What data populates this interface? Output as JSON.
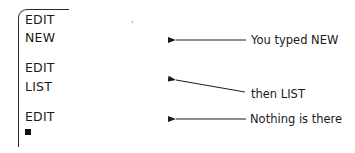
{
  "terminal": {
    "lines": [
      {
        "text": "EDIT"
      },
      {
        "text": "NEW"
      },
      {
        "text": "EDIT"
      },
      {
        "text": "LIST"
      },
      {
        "text": "EDIT"
      }
    ],
    "cursor": "block-cursor"
  },
  "annotations": [
    {
      "text": "You typed NEW",
      "points_to": "NEW"
    },
    {
      "text": "then LIST",
      "points_to": "LIST"
    },
    {
      "text": "Nothing is there",
      "points_to": "EDIT"
    }
  ],
  "colors": {
    "text": "#1a1a1a",
    "frame": "#2a2a2a",
    "background": "#ffffff"
  }
}
